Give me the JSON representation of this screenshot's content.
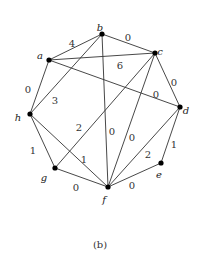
{
  "caption": "(b)",
  "nodes": [
    {
      "id": "a",
      "x": 49,
      "y": 60,
      "lx": 40,
      "ly": 56
    },
    {
      "id": "b",
      "x": 102,
      "y": 34,
      "lx": 100,
      "ly": 28
    },
    {
      "id": "c",
      "x": 155,
      "y": 53,
      "lx": 160,
      "ly": 52
    },
    {
      "id": "d",
      "x": 180,
      "y": 107,
      "lx": 186,
      "ly": 111
    },
    {
      "id": "e",
      "x": 161,
      "y": 163,
      "lx": 159,
      "ly": 175
    },
    {
      "id": "f",
      "x": 108,
      "y": 187,
      "lx": 104,
      "ly": 200
    },
    {
      "id": "g",
      "x": 55,
      "y": 168,
      "lx": 44,
      "ly": 178
    },
    {
      "id": "h",
      "x": 30,
      "y": 114,
      "lx": 18,
      "ly": 118
    }
  ],
  "edges": [
    {
      "from": "a",
      "to": "b",
      "weight": "4",
      "wx": 72,
      "wy": 44
    },
    {
      "from": "b",
      "to": "c",
      "weight": "0",
      "wx": 128,
      "wy": 38
    },
    {
      "from": "a",
      "to": "c",
      "weight": "6",
      "wx": 120,
      "wy": 66
    },
    {
      "from": "a",
      "to": "d",
      "weight": "0",
      "wx": 156,
      "wy": 95
    },
    {
      "from": "c",
      "to": "d",
      "weight": "0",
      "wx": 174,
      "wy": 83
    },
    {
      "from": "a",
      "to": "h",
      "weight": "0",
      "wx": 28,
      "wy": 90
    },
    {
      "from": "b",
      "to": "h",
      "weight": "3",
      "wx": 55,
      "wy": 101
    },
    {
      "from": "b",
      "to": "f",
      "weight": "0",
      "wx": 112,
      "wy": 132
    },
    {
      "from": "c",
      "to": "g",
      "weight": "2",
      "wx": 79,
      "wy": 128
    },
    {
      "from": "c",
      "to": "f",
      "weight": "0",
      "wx": 132,
      "wy": 138
    },
    {
      "from": "d",
      "to": "f",
      "weight": "2",
      "wx": 148,
      "wy": 155
    },
    {
      "from": "d",
      "to": "e",
      "weight": "1",
      "wx": 174,
      "wy": 145
    },
    {
      "from": "e",
      "to": "f",
      "weight": "0",
      "wx": 132,
      "wy": 186
    },
    {
      "from": "h",
      "to": "g",
      "weight": "1",
      "wx": 33,
      "wy": 151
    },
    {
      "from": "h",
      "to": "f",
      "weight": "1",
      "wx": 84,
      "wy": 160
    },
    {
      "from": "g",
      "to": "f",
      "weight": "0",
      "wx": 76,
      "wy": 188
    }
  ]
}
